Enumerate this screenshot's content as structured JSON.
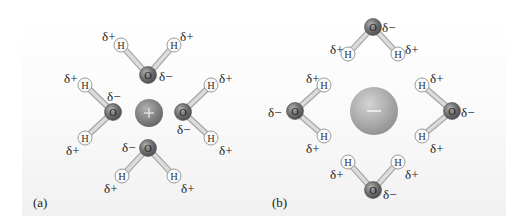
{
  "panels": [
    {
      "label": "(a)",
      "ion": {
        "charge": "+",
        "type": "cation",
        "x": 149,
        "y": 113,
        "r": 14
      },
      "molecules": [
        {
          "name": "top",
          "O": [
            148,
            75
          ],
          "H1": [
            121,
            45
          ],
          "H2": [
            174,
            45
          ],
          "labels": [
            {
              "t": "δ+",
              "x": 102,
              "y": 29
            },
            {
              "t": "δ+",
              "x": 180,
              "y": 29
            },
            {
              "t": "δ−",
              "x": 159,
              "y": 69
            }
          ]
        },
        {
          "name": "left",
          "O": [
            113,
            112
          ],
          "H1": [
            85,
            85
          ],
          "H2": [
            85,
            138
          ],
          "labels": [
            {
              "t": "δ+",
              "x": 64,
              "y": 71
            },
            {
              "t": "δ−",
              "x": 107,
              "y": 89
            },
            {
              "t": "δ+",
              "x": 66,
              "y": 143
            }
          ]
        },
        {
          "name": "right",
          "O": [
            183,
            112
          ],
          "H1": [
            211,
            85
          ],
          "H2": [
            211,
            138
          ],
          "labels": [
            {
              "t": "δ+",
              "x": 219,
              "y": 71
            },
            {
              "t": "δ−",
              "x": 177,
              "y": 122
            },
            {
              "t": "δ+",
              "x": 219,
              "y": 143
            }
          ]
        },
        {
          "name": "bottom",
          "O": [
            148,
            148
          ],
          "H1": [
            122,
            176
          ],
          "H2": [
            174,
            176
          ],
          "labels": [
            {
              "t": "δ−",
              "x": 122,
              "y": 140
            },
            {
              "t": "δ+",
              "x": 104,
              "y": 181
            },
            {
              "t": "δ+",
              "x": 181,
              "y": 181
            }
          ]
        }
      ],
      "label_pos": {
        "x": 33,
        "y": 195
      }
    },
    {
      "label": "(b)",
      "ion": {
        "charge": "−",
        "type": "anion",
        "x": 374,
        "y": 111,
        "r": 24
      },
      "molecules": [
        {
          "name": "top",
          "O": [
            373,
            27
          ],
          "H1": [
            348,
            54
          ],
          "H2": [
            398,
            54
          ],
          "labels": [
            {
              "t": "δ+",
              "x": 330,
              "y": 42
            },
            {
              "t": "δ−",
              "x": 382,
              "y": 20
            },
            {
              "t": "δ+",
              "x": 405,
              "y": 42
            }
          ]
        },
        {
          "name": "left",
          "O": [
            295,
            111
          ],
          "H1": [
            324,
            85
          ],
          "H2": [
            324,
            136
          ],
          "labels": [
            {
              "t": "δ+",
              "x": 306,
              "y": 71
            },
            {
              "t": "δ−",
              "x": 268,
              "y": 105
            },
            {
              "t": "δ+",
              "x": 306,
              "y": 141
            }
          ]
        },
        {
          "name": "right",
          "O": [
            452,
            111
          ],
          "H1": [
            422,
            85
          ],
          "H2": [
            422,
            136
          ],
          "labels": [
            {
              "t": "δ+",
              "x": 430,
              "y": 71
            },
            {
              "t": "δ−",
              "x": 461,
              "y": 105
            },
            {
              "t": "δ+",
              "x": 430,
              "y": 141
            }
          ]
        },
        {
          "name": "bottom",
          "O": [
            373,
            190
          ],
          "H1": [
            348,
            162
          ],
          "H2": [
            398,
            162
          ],
          "labels": [
            {
              "t": "δ+",
              "x": 330,
              "y": 167
            },
            {
              "t": "δ+",
              "x": 405,
              "y": 167
            },
            {
              "t": "δ−",
              "x": 383,
              "y": 187
            }
          ]
        }
      ],
      "label_pos": {
        "x": 272,
        "y": 195
      }
    }
  ],
  "atom_text": {
    "oxygen": "O",
    "hydrogen": "H"
  },
  "colors": {
    "oxygen": "#6b6b6b",
    "hydrogen_fill": "#fafafa",
    "hydrogen_stroke": "#9a9a9a",
    "bond": "#c8c8c8",
    "ion": "#8a8a8a",
    "text": "#222222"
  }
}
